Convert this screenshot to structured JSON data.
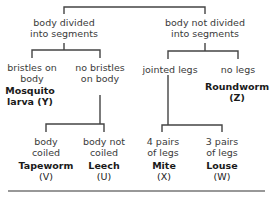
{
  "diagram": {
    "type": "dichotomous-key",
    "line_color": "#444444",
    "nodes": {
      "segmented": {
        "line1": "body divided",
        "line2": "into segments"
      },
      "not_segmented": {
        "line1": "body not divided",
        "line2": "into segments"
      },
      "bristles": {
        "line1": "bristles on",
        "line2": "body"
      },
      "no_bristles": {
        "line1": "no bristles",
        "line2": "on body"
      },
      "jointed_legs": {
        "line1": "jointed legs"
      },
      "no_legs": {
        "line1": "no legs"
      },
      "coiled": {
        "line1": "body",
        "line2": "coiled"
      },
      "not_coiled": {
        "line1": "body not",
        "line2": "coiled"
      },
      "four_pairs": {
        "line1": "4 pairs",
        "line2": "of legs"
      },
      "three_pairs": {
        "line1": "3 pairs",
        "line2": "of legs"
      }
    },
    "organisms": {
      "mosquito": {
        "line1": "Mosquito",
        "line2": "larva (Y)"
      },
      "roundworm": {
        "name": "Roundworm",
        "code": "(Z)"
      },
      "tapeworm": {
        "name": "Tapeworm",
        "code": "(V)"
      },
      "leech": {
        "name": "Leech",
        "code": "(U)"
      },
      "mite": {
        "name": "Mite",
        "code": "(X)"
      },
      "louse": {
        "name": "Louse",
        "code": "(W)"
      }
    }
  }
}
